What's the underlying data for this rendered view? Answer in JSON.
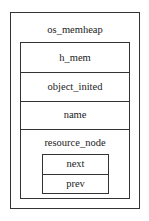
{
  "diagram": {
    "title": "os_memheap",
    "fields": [
      "h_mem",
      "object_inited",
      "name",
      "resource_node"
    ],
    "resource_node": {
      "label": "resource_node",
      "fields": [
        "next",
        "prev"
      ]
    }
  }
}
